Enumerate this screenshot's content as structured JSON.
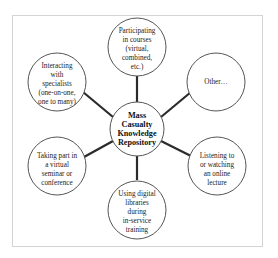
{
  "diagram": {
    "type": "hub-and-spoke",
    "center": {
      "lines": [
        "Mass",
        "Casualty",
        "Knowledge",
        "Repository"
      ]
    },
    "nodes": [
      {
        "id": "courses",
        "position": "top",
        "lines": [
          "Participating",
          "in courses",
          "(virtual,",
          "combined,",
          "etc.)"
        ]
      },
      {
        "id": "other",
        "position": "top-right",
        "lines": [
          "Other…"
        ]
      },
      {
        "id": "lecture",
        "position": "bottom-right",
        "lines": [
          "Listening to",
          "or watching",
          "an online",
          "lecture"
        ]
      },
      {
        "id": "libraries",
        "position": "bottom",
        "lines": [
          "Using digital",
          "libraries",
          "during",
          "in-service",
          "training"
        ]
      },
      {
        "id": "seminar",
        "position": "bottom-left",
        "lines": [
          "Taking part in",
          "a virtual",
          "seminar or",
          "conference"
        ]
      },
      {
        "id": "specialists",
        "position": "top-left",
        "lines": [
          "Interacting",
          "with",
          "specialists",
          "(one-on-one,",
          "one to many)"
        ]
      }
    ],
    "colors": {
      "circle_stroke": "#555555",
      "connector": "#2b2b2b",
      "frame": "#d4d4d4",
      "text": "#222222"
    }
  }
}
